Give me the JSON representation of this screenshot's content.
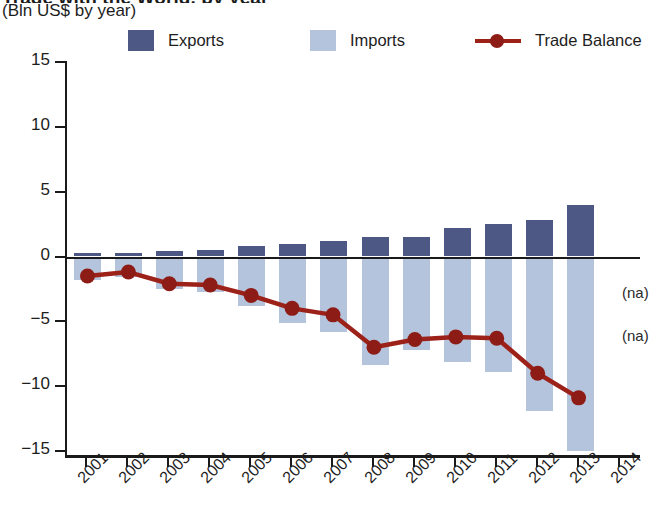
{
  "header": {
    "title_clipped": "Trade with the World, by year",
    "subtitle": "(Bln US$ by year)"
  },
  "legend": {
    "items": [
      {
        "label": "Exports",
        "marker": "square",
        "color": "#4e5885"
      },
      {
        "label": "Imports",
        "marker": "square",
        "color": "#b4c4dc"
      },
      {
        "label": "Trade Balance",
        "marker": "line-dot",
        "color": "#9c2119"
      }
    ]
  },
  "annotations": [
    {
      "text": "(na)",
      "x": 555,
      "y": 222
    },
    {
      "text": "(na)",
      "x": 555,
      "y": 265
    }
  ],
  "chart_data": {
    "type": "bar",
    "title": "Trade with the World, by year",
    "subtitle": "(Bln US$ by year)",
    "xlabel": "",
    "ylabel": "Bln US$",
    "ylim": [
      -15,
      15
    ],
    "yticks": [
      15,
      10,
      5,
      0,
      -5,
      -10,
      -15
    ],
    "grid": false,
    "legend_position": "top",
    "categories": [
      "2001",
      "2002",
      "2003",
      "2004",
      "2005",
      "2006",
      "2007",
      "2008",
      "2009",
      "2010",
      "2011",
      "2012",
      "2013",
      "2014"
    ],
    "series": [
      {
        "name": "Exports",
        "type": "bar",
        "color": "#4e5885",
        "values": [
          0.3,
          0.3,
          0.4,
          0.5,
          0.8,
          1.0,
          1.2,
          1.5,
          1.5,
          2.2,
          2.5,
          2.8,
          4.0,
          null
        ]
      },
      {
        "name": "Imports",
        "type": "bar",
        "color": "#b4c4dc",
        "values": [
          -1.8,
          -1.6,
          -2.5,
          -2.7,
          -3.8,
          -5.1,
          -5.8,
          -8.4,
          -7.2,
          -8.1,
          -8.9,
          -11.9,
          -15.0,
          null
        ]
      },
      {
        "name": "Trade Balance",
        "type": "line",
        "color": "#9c2119",
        "values": [
          -1.5,
          -1.2,
          -2.1,
          -2.2,
          -3.0,
          -4.0,
          -4.5,
          -7.0,
          -6.4,
          -6.2,
          -6.3,
          -9.0,
          -10.9,
          null
        ]
      }
    ]
  }
}
